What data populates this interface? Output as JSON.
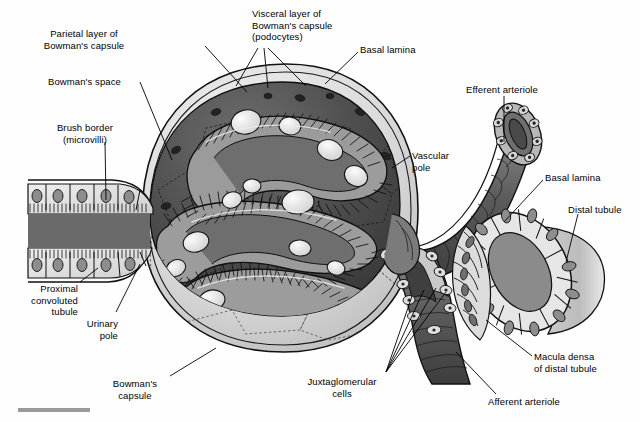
{
  "figure": {
    "kind": "anatomical-illustration",
    "palette": {
      "background": "#fefefe",
      "ink": "#000000",
      "capsule_light": "#d8d8d8",
      "bowman_space_dark": "#4a4a4a",
      "capillary_mid": "#8d8d8d",
      "podocyte_light": "#e9e9e9",
      "arteriole_dark": "#5d5d5d",
      "tubule_fill": "#dcdcdc",
      "nucleus": "#8a8a8a",
      "scalebar": "#9a9a9a"
    },
    "scale_bar": {
      "present": true,
      "label": ""
    }
  },
  "labels": [
    {
      "id": "parietal-layer",
      "text": "Parietal layer of\nBowman's capsule",
      "align": "center",
      "x": 84,
      "y": 28,
      "w": 120
    },
    {
      "id": "visceral-layer",
      "text": "Visceral layer of\nBowman's capsule\n(podocytes)",
      "align": "left",
      "x": 252,
      "y": 8,
      "w": 110
    },
    {
      "id": "basal-lamina-top",
      "text": "Basal lamina",
      "align": "left",
      "x": 360,
      "y": 44,
      "w": 70
    },
    {
      "id": "bowmans-space",
      "text": "Bowman's space",
      "align": "left",
      "x": 48,
      "y": 76,
      "w": 90
    },
    {
      "id": "brush-border",
      "text": "Brush border\n(microvilli)",
      "align": "center",
      "x": 84,
      "y": 122,
      "w": 90
    },
    {
      "id": "efferent-arteriole",
      "text": "Efferent arteriole",
      "align": "left",
      "x": 466,
      "y": 84,
      "w": 100
    },
    {
      "id": "vascular-pole",
      "text": "Vascular\npole",
      "align": "left",
      "x": 412,
      "y": 150,
      "w": 56
    },
    {
      "id": "basal-lamina-right",
      "text": "Basal lamina",
      "align": "left",
      "x": 545,
      "y": 172,
      "w": 76
    },
    {
      "id": "distal-tubule",
      "text": "Distal tubule",
      "align": "left",
      "x": 572,
      "y": 204,
      "w": 68
    },
    {
      "id": "proximal-tubule",
      "text": "Proximal\nconvoluted\ntubule",
      "align": "right",
      "x": 14,
      "y": 283,
      "w": 64
    },
    {
      "id": "urinary-pole",
      "text": "Urinary\npole",
      "align": "right",
      "x": 72,
      "y": 318,
      "w": 46
    },
    {
      "id": "bowmans-capsule",
      "text": "Bowman's\ncapsule",
      "align": "center",
      "x": 130,
      "y": 378,
      "w": 66
    },
    {
      "id": "juxtaglomerular",
      "text": "Juxtaglomerular\ncells",
      "align": "center",
      "x": 338,
      "y": 376,
      "w": 86
    },
    {
      "id": "macula-densa",
      "text": "Macula densa\nof distal tubule",
      "align": "left",
      "x": 534,
      "y": 351,
      "w": 98
    },
    {
      "id": "afferent-arteriole",
      "text": "Afferent arteriole",
      "align": "left",
      "x": 488,
      "y": 396,
      "w": 96
    }
  ],
  "structures": [
    {
      "id": "bowmans-capsule-outer",
      "name": "Bowman's capsule outer wall"
    },
    {
      "id": "bowmans-space",
      "name": "Bowman's space"
    },
    {
      "id": "glomerular-capillaries",
      "name": "Glomerular capillary tuft"
    },
    {
      "id": "podocytes",
      "name": "Podocytes"
    },
    {
      "id": "proximal-tubule",
      "name": "Proximal convoluted tubule"
    },
    {
      "id": "brush-border",
      "name": "Brush border microvilli"
    },
    {
      "id": "afferent-arteriole",
      "name": "Afferent arteriole"
    },
    {
      "id": "efferent-arteriole",
      "name": "Efferent arteriole"
    },
    {
      "id": "distal-tubule",
      "name": "Distal tubule"
    },
    {
      "id": "macula-densa",
      "name": "Macula densa"
    },
    {
      "id": "juxtaglomerular-cells",
      "name": "Juxtaglomerular cells"
    }
  ]
}
